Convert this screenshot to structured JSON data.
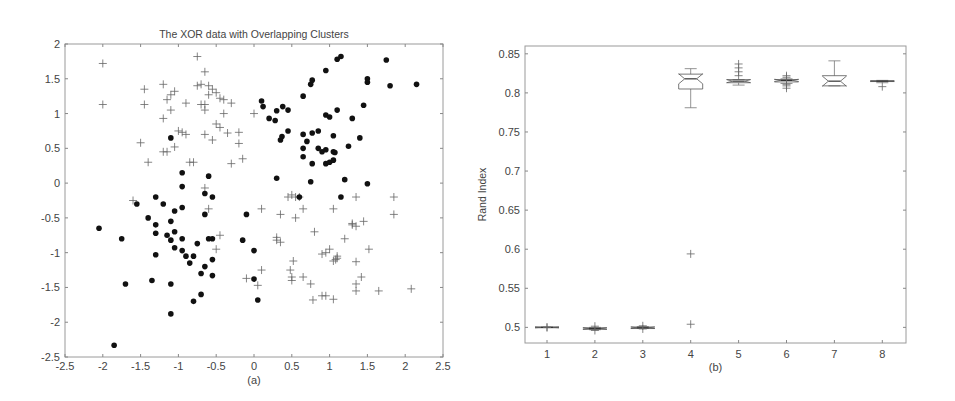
{
  "chart_data": [
    {
      "type": "scatter",
      "title": "The XOR data with Overlapping Clusters",
      "caption": "(a)",
      "xlabel": "",
      "ylabel": "",
      "xlim": [
        -2.5,
        2.5
      ],
      "ylim": [
        -2.5,
        2
      ],
      "xticks": [
        -2.5,
        -2,
        -1.5,
        -1,
        -0.5,
        0,
        0.5,
        1,
        1.5,
        2,
        2.5
      ],
      "yticks": [
        -2.5,
        -2,
        -1.5,
        -1,
        -0.5,
        0,
        0.5,
        1,
        1.5,
        2
      ],
      "xtick_labels": [
        "-2.5",
        "-2",
        "-1.5",
        "-1",
        "-0.5",
        "0",
        "0.5",
        "1",
        "1.5",
        "2",
        "2.5"
      ],
      "ytick_labels": [
        "-2.5",
        "-2",
        "-1.5",
        "-1",
        "-0.5",
        "0",
        "0.5",
        "1",
        "1.5",
        "2"
      ],
      "grid": false,
      "series": [
        {
          "name": "class-dot",
          "marker": "filled-circle",
          "color": "#111111",
          "points": [
            [
              -1.1,
              0.65
            ],
            [
              -0.95,
              0.15
            ],
            [
              -0.6,
              0.1
            ],
            [
              -0.95,
              -0.05
            ],
            [
              -0.65,
              -0.15
            ],
            [
              -0.55,
              -0.2
            ],
            [
              -1.3,
              -0.2
            ],
            [
              -1.55,
              -0.3
            ],
            [
              -1.2,
              -0.3
            ],
            [
              -1.4,
              -0.5
            ],
            [
              -1.05,
              -0.4
            ],
            [
              -0.95,
              -0.35
            ],
            [
              -1.1,
              -0.55
            ],
            [
              -1.3,
              -0.6
            ],
            [
              -0.65,
              -0.45
            ],
            [
              -0.1,
              -0.45
            ],
            [
              -2.05,
              -0.65
            ],
            [
              -1.05,
              -0.7
            ],
            [
              -1.3,
              -0.72
            ],
            [
              -1.15,
              -0.75
            ],
            [
              -1.75,
              -0.8
            ],
            [
              -1.1,
              -0.82
            ],
            [
              -0.95,
              -0.8
            ],
            [
              -0.55,
              -0.8
            ],
            [
              -0.6,
              -0.8
            ],
            [
              -0.15,
              -0.82
            ],
            [
              -0.75,
              -0.87
            ],
            [
              -1.05,
              -0.93
            ],
            [
              -0.95,
              -0.97
            ],
            [
              0.0,
              -0.97
            ],
            [
              -1.3,
              -1.03
            ],
            [
              -0.9,
              -1.05
            ],
            [
              -0.8,
              -1.05
            ],
            [
              -0.55,
              -1.1
            ],
            [
              -0.85,
              -1.15
            ],
            [
              -0.65,
              -1.2
            ],
            [
              -0.7,
              -1.3
            ],
            [
              -0.55,
              -1.33
            ],
            [
              -1.7,
              -1.45
            ],
            [
              -1.35,
              -1.4
            ],
            [
              -1.1,
              -1.45
            ],
            [
              0.0,
              -1.38
            ],
            [
              -0.7,
              -1.6
            ],
            [
              -0.8,
              -1.7
            ],
            [
              0.05,
              -1.68
            ],
            [
              -1.1,
              -1.88
            ],
            [
              -1.85,
              -2.33
            ],
            [
              0.1,
              1.18
            ],
            [
              0.12,
              1.1
            ],
            [
              0.2,
              0.93
            ],
            [
              0.28,
              0.9
            ],
            [
              0.3,
              1.04
            ],
            [
              0.38,
              1.1
            ],
            [
              0.45,
              1.05
            ],
            [
              0.65,
              1.25
            ],
            [
              0.75,
              1.42
            ],
            [
              0.77,
              1.48
            ],
            [
              0.95,
              1.62
            ],
            [
              1.1,
              1.78
            ],
            [
              1.15,
              1.82
            ],
            [
              1.5,
              1.5
            ],
            [
              1.5,
              1.45
            ],
            [
              1.75,
              1.77
            ],
            [
              1.8,
              1.4
            ],
            [
              2.15,
              1.42
            ],
            [
              0.95,
              0.98
            ],
            [
              1.0,
              0.95
            ],
            [
              1.1,
              1.05
            ],
            [
              1.3,
              0.93
            ],
            [
              1.45,
              1.12
            ],
            [
              1.4,
              0.65
            ],
            [
              1.25,
              0.53
            ],
            [
              0.35,
              0.62
            ],
            [
              0.37,
              0.67
            ],
            [
              0.45,
              0.75
            ],
            [
              0.65,
              0.7
            ],
            [
              0.7,
              0.6
            ],
            [
              0.77,
              0.72
            ],
            [
              0.85,
              0.75
            ],
            [
              0.65,
              0.5
            ],
            [
              0.85,
              0.5
            ],
            [
              0.9,
              0.45
            ],
            [
              0.95,
              0.48
            ],
            [
              1.05,
              0.45
            ],
            [
              1.07,
              0.44
            ],
            [
              1.05,
              0.68
            ],
            [
              0.65,
              0.38
            ],
            [
              0.77,
              0.28
            ],
            [
              0.95,
              0.28
            ],
            [
              1.0,
              0.3
            ],
            [
              1.05,
              0.33
            ],
            [
              0.3,
              0.07
            ],
            [
              0.75,
              0.02
            ],
            [
              1.2,
              0.05
            ],
            [
              1.5,
              -0.01
            ],
            [
              0.6,
              -0.2
            ],
            [
              1.15,
              -0.2
            ]
          ]
        },
        {
          "name": "class-plus",
          "marker": "plus",
          "color": "#666666",
          "points": [
            [
              -2.0,
              1.72
            ],
            [
              -2.0,
              1.13
            ],
            [
              -1.45,
              1.35
            ],
            [
              -1.45,
              1.13
            ],
            [
              -1.2,
              1.42
            ],
            [
              -1.05,
              1.32
            ],
            [
              -1.1,
              1.27
            ],
            [
              -1.15,
              1.2
            ],
            [
              -1.1,
              1.05
            ],
            [
              -1.2,
              0.93
            ],
            [
              -0.9,
              1.15
            ],
            [
              -0.75,
              1.82
            ],
            [
              -0.75,
              1.4
            ],
            [
              -0.7,
              1.42
            ],
            [
              -0.65,
              1.6
            ],
            [
              -0.6,
              1.4
            ],
            [
              -0.55,
              1.35
            ],
            [
              -0.5,
              1.3
            ],
            [
              -0.45,
              1.22
            ],
            [
              -0.4,
              1.2
            ],
            [
              -0.3,
              1.15
            ],
            [
              -0.6,
              1.27
            ],
            [
              -0.65,
              1.13
            ],
            [
              -0.7,
              1.13
            ],
            [
              -0.65,
              1.05
            ],
            [
              -0.4,
              1.0
            ],
            [
              -0.5,
              0.85
            ],
            [
              -0.45,
              0.8
            ],
            [
              0.0,
              1.0
            ],
            [
              -1.0,
              0.75
            ],
            [
              -0.95,
              0.73
            ],
            [
              -0.9,
              0.7
            ],
            [
              -0.65,
              0.7
            ],
            [
              -0.55,
              0.62
            ],
            [
              -0.35,
              0.72
            ],
            [
              -0.2,
              0.73
            ],
            [
              -0.2,
              0.57
            ],
            [
              -1.5,
              0.58
            ],
            [
              -1.4,
              0.3
            ],
            [
              -1.2,
              0.45
            ],
            [
              -1.15,
              0.45
            ],
            [
              -1.05,
              0.52
            ],
            [
              -0.85,
              0.3
            ],
            [
              -0.8,
              0.3
            ],
            [
              -0.3,
              0.28
            ],
            [
              -0.15,
              0.35
            ],
            [
              -0.65,
              -0.07
            ],
            [
              -1.6,
              -0.25
            ],
            [
              -0.6,
              -0.37
            ],
            [
              -0.45,
              -0.75
            ],
            [
              -0.5,
              -0.95
            ],
            [
              0.1,
              -0.37
            ],
            [
              0.35,
              -0.45
            ],
            [
              0.45,
              -0.2
            ],
            [
              0.5,
              -0.17
            ],
            [
              0.55,
              -0.2
            ],
            [
              0.6,
              -0.2
            ],
            [
              0.65,
              -0.37
            ],
            [
              0.55,
              -0.5
            ],
            [
              1.05,
              -0.37
            ],
            [
              1.35,
              -0.2
            ],
            [
              1.85,
              -0.2
            ],
            [
              1.85,
              -0.45
            ],
            [
              1.45,
              -0.55
            ],
            [
              1.3,
              -0.6
            ],
            [
              1.35,
              -0.62
            ],
            [
              1.3,
              -0.58
            ],
            [
              0.8,
              -0.7
            ],
            [
              1.2,
              -0.8
            ],
            [
              0.3,
              -0.78
            ],
            [
              0.3,
              -0.82
            ],
            [
              0.35,
              -0.85
            ],
            [
              1.0,
              -0.95
            ],
            [
              0.9,
              -1.02
            ],
            [
              0.95,
              -1.0
            ],
            [
              1.1,
              -1.05
            ],
            [
              1.05,
              -1.12
            ],
            [
              1.08,
              -1.1
            ],
            [
              1.1,
              -1.08
            ],
            [
              1.52,
              -0.95
            ],
            [
              1.35,
              -1.13
            ],
            [
              0.52,
              -1.12
            ],
            [
              0.1,
              -1.25
            ],
            [
              -0.1,
              -1.37
            ],
            [
              0.05,
              -1.47
            ],
            [
              0.48,
              -1.25
            ],
            [
              0.5,
              -1.35
            ],
            [
              0.5,
              -1.4
            ],
            [
              0.65,
              -1.35
            ],
            [
              0.75,
              -1.45
            ],
            [
              1.35,
              -1.45
            ],
            [
              1.35,
              -1.55
            ],
            [
              1.42,
              -1.35
            ],
            [
              1.65,
              -1.55
            ],
            [
              2.08,
              -1.52
            ],
            [
              0.78,
              -1.68
            ],
            [
              0.9,
              -1.62
            ],
            [
              0.95,
              -1.62
            ],
            [
              1.05,
              -1.67
            ]
          ]
        }
      ]
    },
    {
      "type": "box",
      "title": "",
      "caption": "(b)",
      "xlabel": "",
      "ylabel": "Rand Index",
      "ylim": [
        0.48,
        0.86
      ],
      "categories": [
        "1",
        "2",
        "3",
        "4",
        "5",
        "6",
        "7",
        "8"
      ],
      "yticks": [
        0.5,
        0.55,
        0.6,
        0.65,
        0.7,
        0.75,
        0.8,
        0.85
      ],
      "ytick_labels": [
        "0.5",
        "0.55",
        "0.6",
        "0.65",
        "0.7",
        "0.75",
        "0.8",
        "0.85"
      ],
      "grid": false,
      "boxes": [
        {
          "category": "1",
          "whisker_low": 0.5,
          "q1": 0.4995,
          "median": 0.5,
          "q3": 0.5005,
          "whisker_high": 0.5,
          "outliers": [
            0.4998,
            0.5002
          ]
        },
        {
          "category": "2",
          "whisker_low": 0.497,
          "q1": 0.4975,
          "median": 0.4985,
          "q3": 0.4995,
          "whisker_high": 0.5,
          "outliers": [
            0.496,
            0.5015
          ]
        },
        {
          "category": "3",
          "whisker_low": 0.499,
          "q1": 0.4985,
          "median": 0.4995,
          "q3": 0.5005,
          "whisker_high": 0.501,
          "outliers": [
            0.498,
            0.502
          ]
        },
        {
          "category": "4",
          "whisker_low": 0.781,
          "q1": 0.805,
          "median": 0.818,
          "q3": 0.824,
          "whisker_high": 0.831,
          "outliers": [
            0.594,
            0.504
          ]
        },
        {
          "category": "5",
          "whisker_low": 0.81,
          "q1": 0.813,
          "median": 0.815,
          "q3": 0.817,
          "whisker_high": 0.817,
          "outliers": [
            0.822,
            0.827,
            0.832,
            0.837
          ]
        },
        {
          "category": "6",
          "whisker_low": 0.812,
          "q1": 0.814,
          "median": 0.816,
          "q3": 0.817,
          "whisker_high": 0.818,
          "outliers": [
            0.806,
            0.809,
            0.811,
            0.82,
            0.822
          ]
        },
        {
          "category": "7",
          "whisker_low": 0.809,
          "q1": 0.809,
          "median": 0.815,
          "q3": 0.822,
          "whisker_high": 0.841,
          "outliers": []
        },
        {
          "category": "8",
          "whisker_low": 0.813,
          "q1": 0.8145,
          "median": 0.815,
          "q3": 0.8155,
          "whisker_high": 0.816,
          "outliers": [
            0.808
          ]
        }
      ]
    }
  ]
}
